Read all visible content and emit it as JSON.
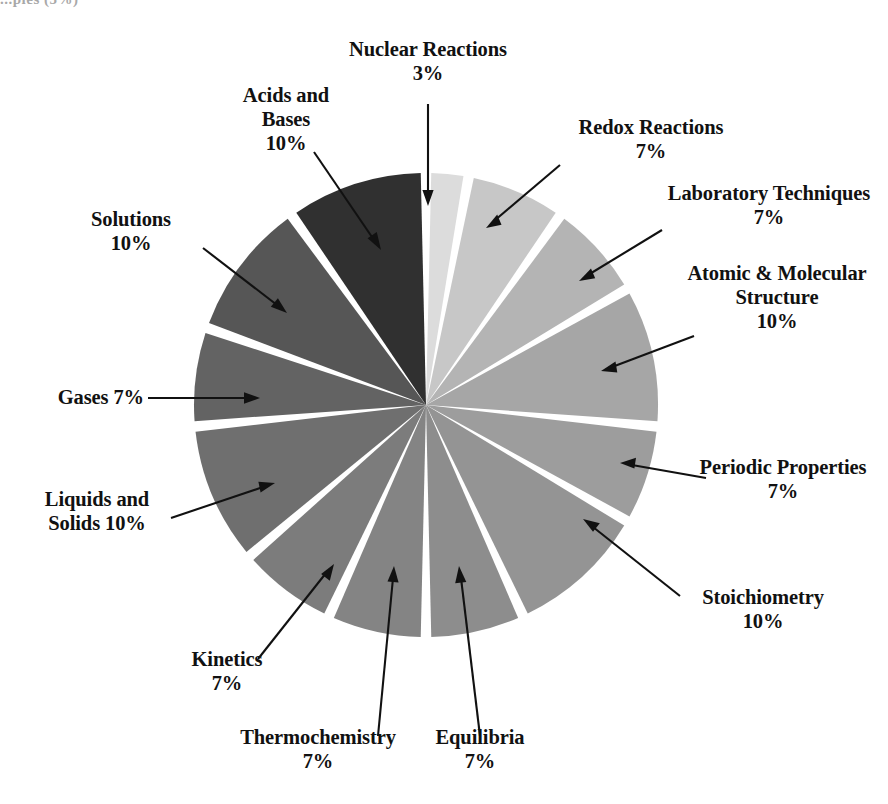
{
  "corner_fragment": "...pies (5%)",
  "chart_data": {
    "type": "pie",
    "title": "",
    "unit": "%",
    "start_angle_deg": -90,
    "direction": "clockwise",
    "gap_deg": 2.6,
    "center": [
      426,
      405
    ],
    "radius": 232,
    "legend": "none",
    "categories": [
      "Nuclear Reactions",
      "Redox Reactions",
      "Laboratory Techniques",
      "Atomic & Molecular Structure",
      "Periodic Properties",
      "Stoichiometry",
      "Equilibria",
      "Thermochemistry",
      "Kinetics",
      "Liquids and Solids",
      "Gases",
      "Solutions",
      "Acids and Bases"
    ],
    "values": [
      3,
      7,
      7,
      10,
      7,
      10,
      7,
      7,
      7,
      10,
      7,
      10,
      10
    ],
    "colors": [
      "#dcdcdc",
      "#c7c7c7",
      "#b4b4b4",
      "#a6a6a6",
      "#9d9d9d",
      "#949494",
      "#8d8d8d",
      "#848484",
      "#7c7c7c",
      "#6f6f6f",
      "#636363",
      "#565656",
      "#303030"
    ],
    "slices": [
      {
        "label": "Nuclear Reactions",
        "value": 3,
        "percent_text": "3%",
        "color": "#dcdcdc"
      },
      {
        "label": "Redox Reactions",
        "value": 7,
        "percent_text": "7%",
        "color": "#c7c7c7"
      },
      {
        "label": "Laboratory Techniques",
        "value": 7,
        "percent_text": "7%",
        "color": "#b4b4b4"
      },
      {
        "label": "Atomic & Molecular Structure",
        "value": 10,
        "percent_text": "10%",
        "color": "#a6a6a6"
      },
      {
        "label": "Periodic Properties",
        "value": 7,
        "percent_text": "7%",
        "color": "#9d9d9d"
      },
      {
        "label": "Stoichiometry",
        "value": 10,
        "percent_text": "10%",
        "color": "#949494"
      },
      {
        "label": "Equilibria",
        "value": 7,
        "percent_text": "7%",
        "color": "#8d8d8d"
      },
      {
        "label": "Thermochemistry",
        "value": 7,
        "percent_text": "7%",
        "color": "#848484"
      },
      {
        "label": "Kinetics",
        "value": 7,
        "percent_text": "7%",
        "color": "#7c7c7c"
      },
      {
        "label": "Liquids and Solids",
        "value": 10,
        "percent_text": "10%",
        "color": "#6f6f6f"
      },
      {
        "label": "Gases",
        "value": 7,
        "percent_text": "7%",
        "color": "#636363"
      },
      {
        "label": "Solutions",
        "value": 10,
        "percent_text": "10%",
        "color": "#565656"
      },
      {
        "label": "Acids and Bases",
        "value": 10,
        "percent_text": "10%",
        "color": "#303030"
      }
    ]
  },
  "labels": {
    "nuclear_reactions": "Nuclear Reactions\n3%",
    "redox_reactions": "Redox Reactions\n7%",
    "laboratory_techniques": "Laboratory Techniques\n7%",
    "atomic_molecular_structure": "Atomic & Molecular\nStructure\n10%",
    "periodic_properties": "Periodic Properties\n7%",
    "stoichiometry": "Stoichiometry\n10%",
    "equilibria": "Equilibria\n7%",
    "thermochemistry": "Thermochemistry\n7%",
    "kinetics": "Kinetics\n7%",
    "liquids_and_solids": "Liquids and\nSolids 10%",
    "gases": "Gases 7%",
    "solutions": "Solutions\n10%",
    "acids_and_bases": "Acids and\nBases\n10%"
  }
}
